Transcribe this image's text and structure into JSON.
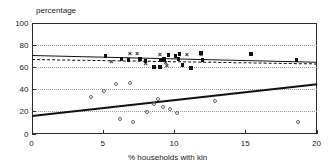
{
  "chart_data": {
    "type": "scatter",
    "title": "",
    "subtitle": "",
    "ylabel": "percentage",
    "xlabel": "% households with kin",
    "xlim": [
      0,
      20
    ],
    "ylim": [
      0,
      100
    ],
    "xticks": [
      0,
      5,
      10,
      15,
      20
    ],
    "yticks": [
      0,
      20,
      40,
      60,
      80,
      100
    ],
    "xtick_labels": [
      "0",
      "5",
      "10",
      "15",
      "20"
    ],
    "ytick_labels": [
      "0",
      "20",
      "40",
      "60",
      "80",
      "100"
    ],
    "grid": "horizontal-dotted",
    "legend": "none",
    "series": [
      {
        "name": "filled-squares",
        "marker": "filled-square",
        "color": "#111111",
        "points": [
          [
            5.2,
            69.5
          ],
          [
            6.3,
            67.0
          ],
          [
            6.8,
            66.5
          ],
          [
            7.6,
            67.5
          ],
          [
            8.0,
            65.0
          ],
          [
            8.6,
            59.5
          ],
          [
            9.0,
            60.0
          ],
          [
            9.1,
            66.0
          ],
          [
            9.3,
            67.5
          ],
          [
            9.6,
            70.5
          ],
          [
            10.1,
            70.0
          ],
          [
            10.3,
            67.0
          ],
          [
            10.4,
            71.5
          ],
          [
            10.6,
            62.0
          ],
          [
            11.2,
            59.0
          ],
          [
            11.9,
            72.5
          ],
          [
            12.0,
            66.0
          ],
          [
            15.4,
            72.0
          ],
          [
            18.6,
            66.5
          ]
        ]
      },
      {
        "name": "cross-markers",
        "marker": "x",
        "color": "#111111",
        "points": [
          [
            5.6,
            64.5
          ],
          [
            6.9,
            72.5
          ],
          [
            7.4,
            72.5
          ],
          [
            8.0,
            63.5
          ],
          [
            9.0,
            71.5
          ],
          [
            9.4,
            64.0
          ],
          [
            9.5,
            61.5
          ],
          [
            10.9,
            71.5
          ],
          [
            11.9,
            71.0
          ]
        ]
      },
      {
        "name": "open-circles",
        "marker": "open-circle",
        "color": "#666666",
        "points": [
          [
            4.2,
            33.0
          ],
          [
            5.1,
            38.5
          ],
          [
            5.9,
            45.0
          ],
          [
            6.2,
            13.0
          ],
          [
            6.9,
            45.5
          ],
          [
            7.1,
            10.5
          ],
          [
            8.1,
            19.0
          ],
          [
            8.6,
            27.0
          ],
          [
            8.9,
            31.5
          ],
          [
            9.2,
            24.0
          ],
          [
            9.7,
            22.0
          ],
          [
            10.2,
            18.5
          ],
          [
            12.9,
            29.5
          ],
          [
            18.7,
            10.5
          ]
        ]
      }
    ],
    "fit_lines": [
      {
        "name": "solid-thin-upper",
        "style": "solid",
        "width": 1.0,
        "color": "#111111",
        "x0": 0,
        "y0": 71.0,
        "x1": 20,
        "y1": 65.0
      },
      {
        "name": "dashed-middle",
        "style": "dashed",
        "width": 1.0,
        "color": "#111111",
        "x0": 0,
        "y0": 67.0,
        "x1": 20,
        "y1": 63.0
      },
      {
        "name": "solid-thick-lower",
        "style": "solid",
        "width": 2.0,
        "color": "#111111",
        "x0": 0,
        "y0": 17.0,
        "x1": 20,
        "y1": 45.5
      }
    ]
  }
}
